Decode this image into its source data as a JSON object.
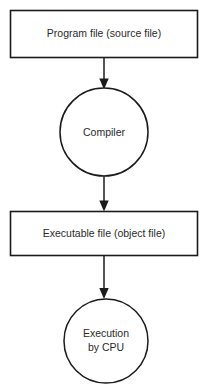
{
  "diagram": {
    "background_color": "#ffffff",
    "stroke_color": "#1b1b1b",
    "text_color": "#2a2a2a",
    "nodes": [
      {
        "id": "source-file",
        "shape": "rectangle",
        "label": "Program file (source file)"
      },
      {
        "id": "compiler",
        "shape": "circle",
        "label": "Compiler"
      },
      {
        "id": "object-file",
        "shape": "rectangle",
        "label": "Executable file (object file)"
      },
      {
        "id": "execution",
        "shape": "circle",
        "label_line1": "Execution",
        "label_line2": "by CPU"
      }
    ],
    "edges": [
      {
        "id": "edge-source-to-compiler",
        "from": "source-file",
        "to": "compiler",
        "arrow": "down"
      },
      {
        "id": "edge-compiler-to-object",
        "from": "compiler",
        "to": "object-file",
        "arrow": "down"
      },
      {
        "id": "edge-object-to-execution",
        "from": "object-file",
        "to": "execution",
        "arrow": "down"
      }
    ]
  }
}
